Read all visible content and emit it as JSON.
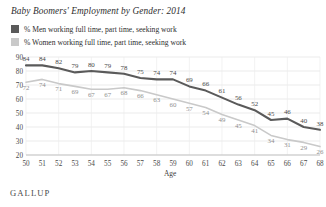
{
  "title": "Baby Boomers' Employment by Gender: 2014",
  "brand": "GALLUP",
  "legend": {
    "items": [
      {
        "label": "% Men working full time, part time, seeking work",
        "color": "#5a5a5a"
      },
      {
        "label": "% Women working full time, part time, seeking work",
        "color": "#c9c9c9"
      }
    ]
  },
  "chart_data": {
    "type": "line",
    "title": "Baby Boomers' Employment by Gender: 2014",
    "xlabel": "Age",
    "ylabel": "",
    "xlim": [
      50,
      68
    ],
    "ylim": [
      20,
      90
    ],
    "yticks": [
      90,
      80,
      70,
      60,
      50,
      40,
      30,
      20
    ],
    "grid": true,
    "legend_position": "top-left",
    "categories": [
      50,
      51,
      52,
      53,
      54,
      55,
      56,
      57,
      58,
      59,
      60,
      61,
      62,
      63,
      64,
      65,
      66,
      67,
      68
    ],
    "x": [
      50,
      51,
      52,
      53,
      54,
      55,
      56,
      57,
      58,
      59,
      60,
      61,
      62,
      63,
      64,
      65,
      66,
      67,
      68
    ],
    "series": [
      {
        "name": "% Men working full time, part time, seeking work",
        "color": "#5a5a5a",
        "values": [
          84,
          84,
          82,
          79,
          80,
          79,
          78,
          75,
          74,
          74,
          69,
          66,
          61,
          56,
          52,
          45,
          46,
          40,
          38
        ]
      },
      {
        "name": "% Women working full time, part time, seeking work",
        "color": "#c9c9c9",
        "values": [
          72,
          74,
          71,
          69,
          67,
          67,
          68,
          66,
          63,
          60,
          57,
          54,
          49,
          45,
          41,
          34,
          31,
          29,
          26
        ]
      }
    ]
  }
}
